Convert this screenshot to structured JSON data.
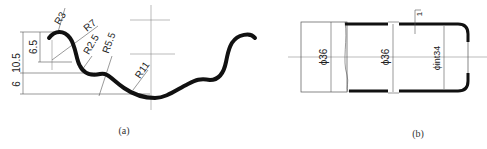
{
  "figure_a": {
    "caption": "(a)",
    "dimensions": {
      "height_total": "10.5",
      "height_upper": "6.5",
      "height_lower": "6",
      "radius_1": "R3",
      "radius_2": "R7",
      "radius_3": "R2.5",
      "radius_4": "R5.5",
      "radius_5": "R11"
    }
  },
  "figure_b": {
    "caption": "(b)",
    "dimensions": {
      "diameter_left": "ϕ36",
      "diameter_middle": "ϕ36",
      "diameter_inner": "ϕint34",
      "wall_thickness": "1"
    }
  },
  "colors": {
    "line": "#111111",
    "thin": "#555555",
    "background": "#ffffff"
  }
}
